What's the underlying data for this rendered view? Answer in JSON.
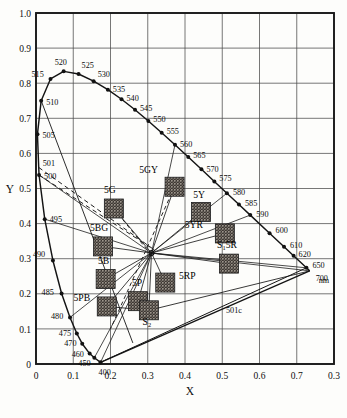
{
  "figure": {
    "type": "chromaticity-diagram",
    "axis_x_label": "X",
    "axis_y_label": "Y",
    "unit_label": "nm",
    "frame": {
      "x0": 36,
      "y0": 13,
      "x1": 334,
      "y1": 364
    },
    "xlim": [
      0.0,
      0.8
    ],
    "ylim": [
      0.0,
      1.0
    ],
    "grid": true
  },
  "chart_data": {
    "type": "scatter",
    "xlabel": "X",
    "ylabel": "Y",
    "xlim": [
      0.0,
      0.8
    ],
    "ylim": [
      0.0,
      1.0
    ],
    "grid": true,
    "legend": "none",
    "xticks": [
      "0",
      "0.1",
      "0.2",
      "0.3",
      "0.4",
      "0.5",
      "0.6",
      "0.7",
      "0.3"
    ],
    "xtick_values": [
      0.0,
      0.1,
      0.2,
      0.3,
      0.4,
      0.5,
      0.6,
      0.7,
      0.8
    ],
    "yticks": [
      "0",
      "0.1",
      "0.2",
      "0.3",
      "0.4",
      "0.5",
      "0.6",
      "0.7",
      "0.8",
      "0.9",
      "1.0"
    ],
    "ytick_values": [
      0.0,
      0.1,
      0.2,
      0.3,
      0.4,
      0.5,
      0.6,
      0.7,
      0.8,
      0.9,
      1.0
    ],
    "white_point": {
      "label": "illuminant-C",
      "x": 0.3101,
      "y": 0.3162
    },
    "spectral_locus": [
      {
        "nm": "400",
        "x": 0.1733,
        "y": 0.0048,
        "labeled": true,
        "dot": true
      },
      {
        "nm": "450",
        "x": 0.1566,
        "y": 0.0178,
        "labeled": true,
        "dot": true
      },
      {
        "nm": "460",
        "x": 0.144,
        "y": 0.0297,
        "labeled": true,
        "dot": true
      },
      {
        "nm": "470",
        "x": 0.1241,
        "y": 0.0578,
        "labeled": true,
        "dot": true
      },
      {
        "nm": "475",
        "x": 0.1096,
        "y": 0.0868,
        "labeled": true,
        "dot": true
      },
      {
        "nm": "480",
        "x": 0.0913,
        "y": 0.1327,
        "labeled": true,
        "dot": true
      },
      {
        "nm": "485",
        "x": 0.0687,
        "y": 0.2007,
        "labeled": true,
        "dot": true
      },
      {
        "nm": "490",
        "x": 0.0454,
        "y": 0.295,
        "labeled": true,
        "dot": true
      },
      {
        "nm": "495",
        "x": 0.0235,
        "y": 0.4127,
        "labeled": true,
        "dot": true
      },
      {
        "nm": "500",
        "x": 0.0082,
        "y": 0.5384,
        "labeled": true,
        "dot": true
      },
      {
        "nm": "501",
        "x": 0.0073,
        "y": 0.56,
        "labeled": true,
        "dot": false
      },
      {
        "nm": "505",
        "x": 0.0039,
        "y": 0.6548,
        "labeled": true,
        "dot": true
      },
      {
        "nm": "510",
        "x": 0.0139,
        "y": 0.7502,
        "labeled": true,
        "dot": true
      },
      {
        "nm": "515",
        "x": 0.0389,
        "y": 0.812,
        "labeled": true,
        "dot": true
      },
      {
        "nm": "520",
        "x": 0.0743,
        "y": 0.8338,
        "labeled": true,
        "dot": true
      },
      {
        "nm": "525",
        "x": 0.1142,
        "y": 0.8262,
        "labeled": true,
        "dot": true
      },
      {
        "nm": "530",
        "x": 0.1547,
        "y": 0.8059,
        "labeled": true,
        "dot": true
      },
      {
        "nm": "535",
        "x": 0.1929,
        "y": 0.7816,
        "labeled": true,
        "dot": true
      },
      {
        "nm": "540",
        "x": 0.2296,
        "y": 0.7543,
        "labeled": true,
        "dot": true
      },
      {
        "nm": "545",
        "x": 0.2658,
        "y": 0.7243,
        "labeled": true,
        "dot": true
      },
      {
        "nm": "550",
        "x": 0.3016,
        "y": 0.6923,
        "labeled": true,
        "dot": true
      },
      {
        "nm": "555",
        "x": 0.3373,
        "y": 0.6589,
        "labeled": true,
        "dot": true
      },
      {
        "nm": "560",
        "x": 0.3731,
        "y": 0.6245,
        "labeled": true,
        "dot": true
      },
      {
        "nm": "565",
        "x": 0.4087,
        "y": 0.5896,
        "labeled": true,
        "dot": true
      },
      {
        "nm": "570",
        "x": 0.4441,
        "y": 0.5547,
        "labeled": true,
        "dot": true
      },
      {
        "nm": "575",
        "x": 0.4788,
        "y": 0.5202,
        "labeled": true,
        "dot": true
      },
      {
        "nm": "580",
        "x": 0.5125,
        "y": 0.4866,
        "labeled": true,
        "dot": true
      },
      {
        "nm": "585",
        "x": 0.5448,
        "y": 0.4544,
        "labeled": true,
        "dot": true
      },
      {
        "nm": "590",
        "x": 0.5752,
        "y": 0.4242,
        "labeled": true,
        "dot": true
      },
      {
        "nm": "600",
        "x": 0.627,
        "y": 0.3725,
        "labeled": true,
        "dot": true
      },
      {
        "nm": "610",
        "x": 0.6658,
        "y": 0.334,
        "labeled": true,
        "dot": true
      },
      {
        "nm": "620",
        "x": 0.6915,
        "y": 0.3083,
        "labeled": true,
        "dot": true
      },
      {
        "nm": "650",
        "x": 0.726,
        "y": 0.274,
        "labeled": true,
        "dot": true
      },
      {
        "nm": "700",
        "x": 0.7347,
        "y": 0.2653,
        "labeled": true,
        "dot": false
      }
    ],
    "munsell_patches": [
      {
        "label": "5G",
        "x": 0.209,
        "y": 0.443,
        "swatch": "halftone-dark"
      },
      {
        "label": "5GY",
        "x": 0.372,
        "y": 0.505,
        "swatch": "halftone-dark"
      },
      {
        "label": "5Y",
        "x": 0.443,
        "y": 0.433,
        "swatch": "halftone-dark"
      },
      {
        "label": "5YR",
        "x": 0.507,
        "y": 0.372,
        "swatch": "halftone-dark"
      },
      {
        "label": "5BG",
        "x": 0.18,
        "y": 0.335,
        "swatch": "halftone-dark"
      },
      {
        "label": "5B",
        "x": 0.187,
        "y": 0.242,
        "swatch": "halftone-dark"
      },
      {
        "label": "5PB",
        "x": 0.19,
        "y": 0.164,
        "swatch": "halftone-dark"
      },
      {
        "label": "5P",
        "x": 0.274,
        "y": 0.179,
        "swatch": "halftone-dark"
      },
      {
        "label": "5RP",
        "x": 0.347,
        "y": 0.232,
        "swatch": "halftone-dark"
      },
      {
        "label": "S1 5R",
        "x": 0.518,
        "y": 0.286,
        "swatch": "halftone-dark",
        "display": "S₁ 5R"
      },
      {
        "label": "S2",
        "x": 0.303,
        "y": 0.153,
        "swatch": "halftone-dark",
        "display": "S₂"
      }
    ],
    "annotations": [
      {
        "text": "501c",
        "x": 0.51,
        "y": 0.145
      },
      {
        "text": "nm",
        "x": 0.759,
        "y": 0.232
      }
    ]
  }
}
